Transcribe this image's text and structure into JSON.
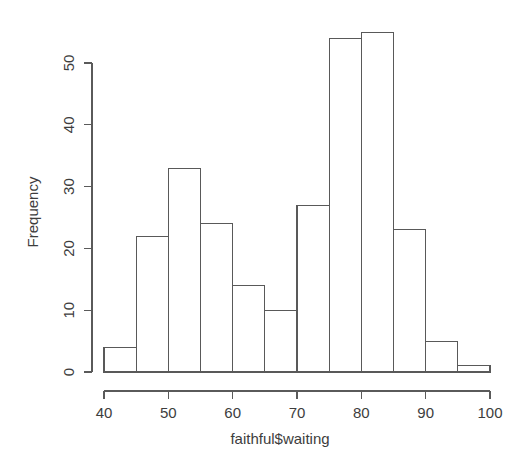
{
  "chart_data": {
    "type": "bar",
    "title": "",
    "subtitle": "",
    "xlabel": "faithful$waiting",
    "ylabel": "Frequency",
    "categories": [
      "40-45",
      "45-50",
      "50-55",
      "55-60",
      "60-65",
      "65-70",
      "70-75",
      "75-80",
      "80-85",
      "85-90",
      "90-95",
      "95-100"
    ],
    "bin_edges": [
      40,
      45,
      50,
      55,
      60,
      65,
      70,
      75,
      80,
      85,
      90,
      95,
      100
    ],
    "values": [
      4,
      22,
      33,
      24,
      14,
      10,
      27,
      54,
      55,
      23,
      5,
      1
    ],
    "bin_width": 5,
    "xlim": [
      40,
      100
    ],
    "ylim": [
      0,
      55
    ],
    "xticks": [
      40,
      50,
      60,
      70,
      80,
      90,
      100
    ],
    "yticks": [
      0,
      10,
      20,
      30,
      40,
      50
    ],
    "xtick_labels": [
      "40",
      "50",
      "60",
      "70",
      "80",
      "90",
      "100"
    ],
    "ytick_labels": [
      "0",
      "10",
      "20",
      "30",
      "40",
      "50"
    ],
    "grid": false,
    "legend": false,
    "legend_position": "none",
    "bar_fill": "#ffffff",
    "bar_stroke": "#595959",
    "background": "#ffffff",
    "text_color": "#3d3d3d"
  },
  "plot": {
    "axis_x_title": "faithful$waiting",
    "axis_y_title": "Frequency"
  }
}
